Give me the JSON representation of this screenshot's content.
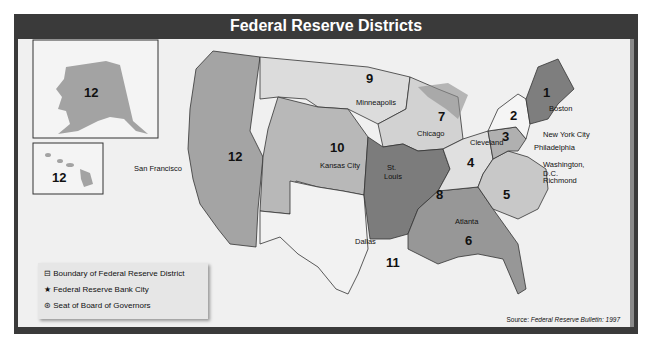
{
  "title": "Federal Reserve Districts",
  "legend": {
    "boundary": {
      "icon": "boundary-icon",
      "label": "Boundary of Federal Reserve District"
    },
    "bank_city": {
      "icon": "star-icon",
      "label": "Federal Reserve Bank City"
    },
    "board_seat": {
      "icon": "circled-star-icon",
      "label": "Seat of Board of Governors"
    }
  },
  "source": {
    "prefix": "Source: ",
    "text": "Federal Reserve Bulletin: 1997"
  },
  "districts": [
    {
      "number": "1",
      "city": "Boston"
    },
    {
      "number": "2",
      "city": "New York City"
    },
    {
      "number": "3",
      "city": "Philadelphia"
    },
    {
      "number": "4",
      "city": "Cleveland"
    },
    {
      "number": "5",
      "city": "Richmond"
    },
    {
      "number": "6",
      "city": "Atlanta"
    },
    {
      "number": "7",
      "city": "Chicago"
    },
    {
      "number": "8",
      "city": "St. Louis"
    },
    {
      "number": "9",
      "city": "Minneapolis"
    },
    {
      "number": "10",
      "city": "Kansas City"
    },
    {
      "number": "11",
      "city": "Dallas"
    },
    {
      "number": "12",
      "city": "San Francisco"
    }
  ],
  "inset_labels": {
    "alaska": "12",
    "hawaii": "12"
  },
  "capital_label": {
    "line1": "Washington,",
    "line2": "D.C."
  },
  "st_louis": {
    "line1": "St.",
    "line2": "Louis"
  }
}
